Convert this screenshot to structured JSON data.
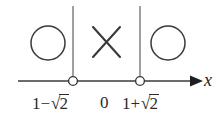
{
  "figure": {
    "axis": {
      "name": "x",
      "line_color": "#3a3a3a",
      "arrow_direction": "right"
    },
    "points": [
      {
        "id": "left-boundary",
        "label_prefix": "1",
        "label_operator": "−",
        "label_radical": "√",
        "label_radicand": "2",
        "label_full": "1−√2",
        "marker": "open-circle",
        "x": 73
      },
      {
        "id": "origin",
        "label_full": "0",
        "marker": "none",
        "x": 106
      },
      {
        "id": "right-boundary",
        "label_prefix": "1",
        "label_operator": "+",
        "label_radical": "√",
        "label_radicand": "2",
        "label_full": "1+√2",
        "marker": "open-circle",
        "x": 140
      }
    ],
    "region_marks": [
      {
        "id": "left-region",
        "symbol": "circle",
        "meaning": "included-region"
      },
      {
        "id": "middle-region",
        "symbol": "cross",
        "meaning": "excluded-region"
      },
      {
        "id": "right-region",
        "symbol": "circle",
        "meaning": "included-region"
      }
    ],
    "colors": {
      "stroke": "#3a3a3a",
      "text": "#2b2b2b",
      "background": "#ffffff"
    }
  }
}
